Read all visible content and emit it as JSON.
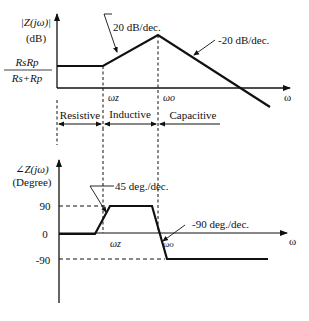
{
  "magnitude_plot": {
    "y_label_line1": "|Z(jω)|",
    "y_label_line2": "(dB)",
    "y_level_numerator": "RsRp",
    "y_level_denominator": "Rs+Rp",
    "x_label": "ω",
    "break_labels": [
      "ωz",
      "ωo"
    ],
    "annotations": [
      "20 dB/dec.",
      "-20 dB/dec."
    ]
  },
  "regions": [
    "Resistive",
    "Inductive",
    "Capacitive"
  ],
  "phase_plot": {
    "y_label_line1": "∠Z(jω)",
    "y_label_line2": "(Degree)",
    "y_ticks": [
      "90",
      "0",
      "-90"
    ],
    "x_label": "ω",
    "break_labels": [
      "ωz",
      "ωo"
    ],
    "annotations": [
      "45 deg./dec.",
      "-90 deg./dec."
    ]
  },
  "colors": {
    "line": "#111111",
    "background": "#ffffff"
  }
}
